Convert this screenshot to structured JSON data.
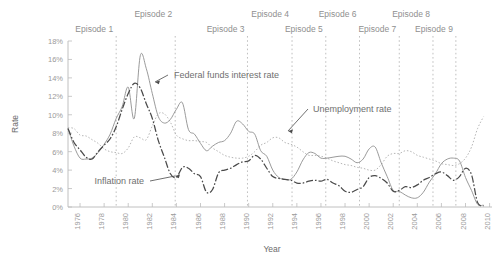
{
  "chart_data": {
    "type": "line",
    "title": "",
    "xlabel": "Year",
    "ylabel": "Rate",
    "xlim": [
      1975,
      2010
    ],
    "ylim": [
      0,
      18
    ],
    "grid": false,
    "legend_position": "inline-annotations",
    "y_tick_labels": [
      "0%",
      "2%",
      "4%",
      "6%",
      "8%",
      "10%",
      "12%",
      "14%",
      "16%",
      "18%"
    ],
    "y_tick_values": [
      0,
      2,
      4,
      6,
      8,
      10,
      12,
      14,
      16,
      18
    ],
    "x_tick_labels": [
      "1976",
      "1978",
      "1980",
      "1982",
      "1984",
      "1986",
      "1988",
      "1990",
      "1992",
      "1994",
      "1996",
      "1998",
      "2000",
      "2002",
      "2004",
      "2006",
      "2008",
      "2010"
    ],
    "x_tick_values": [
      1976,
      1978,
      1980,
      1982,
      1984,
      1986,
      1988,
      1990,
      1992,
      1994,
      1996,
      1998,
      2000,
      2002,
      2004,
      2006,
      2008,
      2010
    ],
    "x": [
      1975.0,
      1975.5,
      1976.0,
      1976.5,
      1977.0,
      1977.5,
      1978.0,
      1978.5,
      1979.0,
      1979.5,
      1980.0,
      1980.5,
      1981.0,
      1981.5,
      1982.0,
      1982.5,
      1983.0,
      1983.5,
      1984.0,
      1984.5,
      1985.0,
      1985.5,
      1986.0,
      1986.5,
      1987.0,
      1987.5,
      1988.0,
      1988.5,
      1989.0,
      1989.5,
      1990.0,
      1990.5,
      1991.0,
      1991.5,
      1992.0,
      1992.5,
      1993.0,
      1993.5,
      1994.0,
      1994.5,
      1995.0,
      1995.5,
      1996.0,
      1996.5,
      1997.0,
      1997.5,
      1998.0,
      1998.5,
      1999.0,
      1999.5,
      2000.0,
      2000.5,
      2001.0,
      2001.5,
      2002.0,
      2002.5,
      2003.0,
      2003.5,
      2004.0,
      2004.5,
      2005.0,
      2005.5,
      2006.0,
      2006.5,
      2007.0,
      2007.5,
      2008.0,
      2008.5,
      2009.0,
      2009.5
    ],
    "series": [
      {
        "name": "Federal funds interest rate",
        "style": "solid-thin",
        "color": "#8e8e8e",
        "values": [
          8.5,
          6.6,
          5.3,
          5.2,
          5.3,
          5.9,
          6.8,
          7.9,
          9.6,
          10.9,
          13.0,
          9.6,
          16.4,
          15.0,
          12.3,
          9.8,
          9.1,
          9.5,
          10.6,
          11.3,
          8.4,
          7.9,
          6.9,
          6.1,
          6.6,
          7.0,
          7.2,
          8.0,
          9.3,
          9.0,
          8.2,
          7.9,
          6.1,
          5.5,
          4.0,
          3.2,
          3.0,
          3.0,
          3.8,
          5.1,
          5.9,
          5.8,
          5.3,
          5.3,
          5.4,
          5.5,
          5.5,
          5.2,
          4.8,
          5.2,
          6.3,
          6.5,
          4.8,
          3.3,
          1.8,
          1.7,
          1.3,
          1.0,
          1.0,
          1.6,
          2.7,
          3.6,
          4.7,
          5.2,
          5.3,
          5.0,
          3.2,
          1.8,
          0.3,
          0.2
        ]
      },
      {
        "name": "Unemployment rate",
        "style": "dotted",
        "color": "#adadad",
        "values": [
          8.6,
          8.5,
          7.8,
          7.7,
          7.3,
          6.9,
          6.3,
          6.0,
          5.9,
          5.8,
          6.4,
          7.6,
          7.5,
          7.3,
          8.8,
          10.1,
          10.1,
          9.2,
          7.8,
          7.4,
          7.2,
          7.2,
          7.1,
          7.0,
          6.4,
          6.0,
          5.6,
          5.4,
          5.3,
          5.3,
          5.5,
          6.0,
          6.7,
          7.0,
          7.5,
          7.5,
          7.0,
          6.8,
          6.5,
          6.0,
          5.6,
          5.6,
          5.5,
          5.3,
          5.0,
          4.8,
          4.6,
          4.5,
          4.3,
          4.2,
          4.0,
          4.0,
          4.6,
          5.5,
          5.8,
          5.8,
          6.1,
          6.0,
          5.6,
          5.4,
          5.2,
          5.0,
          4.7,
          4.6,
          4.5,
          4.7,
          5.3,
          6.5,
          8.5,
          9.8
        ]
      },
      {
        "name": "Inflation rate",
        "style": "dash-dot-heavy",
        "color": "#4a4a4a",
        "values": [
          8.5,
          7.0,
          6.2,
          5.4,
          5.2,
          6.0,
          6.7,
          7.4,
          8.7,
          10.6,
          12.3,
          13.4,
          12.9,
          11.2,
          9.6,
          7.2,
          5.4,
          3.6,
          3.2,
          4.3,
          4.2,
          3.6,
          3.3,
          1.6,
          1.9,
          3.7,
          4.0,
          4.2,
          4.6,
          4.9,
          5.0,
          5.6,
          5.2,
          4.2,
          3.3,
          3.1,
          3.0,
          2.9,
          2.6,
          2.6,
          2.8,
          2.9,
          2.8,
          3.0,
          2.6,
          2.3,
          1.7,
          1.6,
          1.9,
          2.2,
          3.2,
          3.4,
          3.1,
          2.6,
          1.7,
          1.8,
          2.2,
          2.1,
          2.4,
          2.9,
          3.2,
          3.6,
          3.8,
          3.4,
          2.9,
          3.3,
          4.2,
          3.5,
          0.5,
          0.1
        ]
      }
    ],
    "annotations": [
      {
        "label": "Federal funds interest rate",
        "target_x": 1981.2,
        "target_y": 13.0
      },
      {
        "label": "Unemployment rate",
        "target_x": 1991.8,
        "target_y": 7.1
      },
      {
        "label": "Inflation rate",
        "target_x": 1984.0,
        "target_y": 3.3
      }
    ],
    "episodes": [
      {
        "label": "Episode 1",
        "x": 1979.0,
        "row": "lower"
      },
      {
        "label": "Episode 2",
        "x": 1983.9,
        "row": "upper"
      },
      {
        "label": "Episode 3",
        "x": 1989.9,
        "row": "lower"
      },
      {
        "label": "Episode 4",
        "x": 1993.6,
        "row": "upper"
      },
      {
        "label": "Episode 5",
        "x": 1996.4,
        "row": "lower"
      },
      {
        "label": "Episode 6",
        "x": 1999.2,
        "row": "upper"
      },
      {
        "label": "Episode 7",
        "x": 2002.5,
        "row": "lower"
      },
      {
        "label": "Episode 8",
        "x": 2005.3,
        "row": "upper"
      },
      {
        "label": "Episode 9",
        "x": 2007.2,
        "row": "lower"
      }
    ]
  }
}
